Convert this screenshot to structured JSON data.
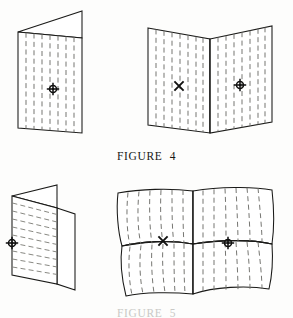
{
  "page": {
    "background_color": "#fdfdfc",
    "ink_color": "#1a1a18",
    "crease_color": "#6f6f6a"
  },
  "captions": {
    "figure4": "FIGURE  4",
    "figure5": "FIGURE  5"
  },
  "figures": [
    {
      "id": "figure-4-folded",
      "label": "folded-sheet-vertical-creases",
      "position": "top-left",
      "crease_orientation": "vertical",
      "markers": [
        {
          "type": "crosshair-circle",
          "x": 53,
          "y": 89
        }
      ]
    },
    {
      "id": "figure-4-open",
      "label": "open-sheet-vertical-creases",
      "position": "top-right",
      "crease_orientation": "vertical",
      "markers": [
        {
          "type": "x-mark",
          "x": 179,
          "y": 86
        },
        {
          "type": "crosshair-circle",
          "x": 240,
          "y": 85
        }
      ]
    },
    {
      "id": "figure-5-folded",
      "label": "folded-sheet-horizontal-creases",
      "position": "bottom-left",
      "crease_orientation": "horizontal",
      "markers": [
        {
          "type": "crosshair-circle",
          "x": 12,
          "y": 243
        }
      ]
    },
    {
      "id": "figure-5-open",
      "label": "warped-open-sheet-curved-creases",
      "position": "bottom-right",
      "crease_orientation": "curved-vertical",
      "markers": [
        {
          "type": "x-mark",
          "x": 163,
          "y": 241
        },
        {
          "type": "crosshair-circle",
          "x": 228,
          "y": 243
        }
      ]
    }
  ],
  "marker_legend": {
    "crosshair_circle": "crosshair-circle-marker",
    "x_mark": "x-marker"
  }
}
